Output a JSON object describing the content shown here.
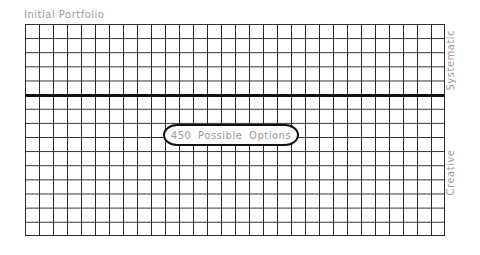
{
  "diagram": {
    "title": "Initial Portfolio",
    "grid": {
      "columns": 30,
      "rows": 15,
      "divider_after_row": 5
    },
    "axis_labels": {
      "top": "Systematic",
      "bottom": "Creative"
    },
    "callout": "450  Possible Options",
    "colors": {
      "grid": "#2a2a2a",
      "divider": "#111111",
      "text": "#9a9a9a"
    }
  }
}
